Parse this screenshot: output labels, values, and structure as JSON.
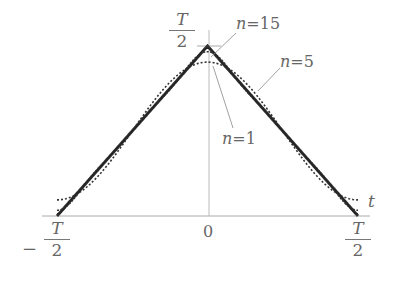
{
  "chart_data": {
    "type": "line",
    "title": "",
    "xlabel": "t",
    "ylabel": "",
    "xlim": [
      "-T/2",
      "T/2"
    ],
    "ylim": [
      0,
      "T/2"
    ],
    "x_ticks": [
      {
        "value": -0.5,
        "label_num": "T",
        "label_den": "2",
        "sign": "−"
      },
      {
        "value": 0,
        "label": "0"
      },
      {
        "value": 0.5,
        "label_num": "T",
        "label_den": "2",
        "sign": ""
      }
    ],
    "y_ticks": [
      {
        "value": 0.5,
        "label_num": "T",
        "label_den": "2"
      }
    ],
    "grid": false,
    "series": [
      {
        "name": "exact",
        "label": "",
        "style": "solid-thick",
        "terms": 0
      },
      {
        "name": "n=1",
        "label": "n=1",
        "style": "dotted",
        "terms": 1
      },
      {
        "name": "n=5",
        "label": "n=5",
        "style": "dotted",
        "terms": 5
      },
      {
        "name": "n=15",
        "label": "n=15",
        "style": "solid",
        "terms": 15
      }
    ],
    "annotations": [
      {
        "text_var": "n",
        "text_eq": "=15",
        "points_to": "peak"
      },
      {
        "text_var": "n",
        "text_eq": "=5",
        "points_to": "right slope"
      },
      {
        "text_var": "n",
        "text_eq": "=1",
        "points_to": "peak region"
      }
    ]
  },
  "labels": {
    "t_axis": "t",
    "zero": "0",
    "T": "T",
    "two": "2",
    "minus": "−",
    "n": "n",
    "eq15": "=15",
    "eq5": "=5",
    "eq1": "=1"
  },
  "colors": {
    "curve": "#333333",
    "axis": "#999999",
    "text": "#666666"
  }
}
